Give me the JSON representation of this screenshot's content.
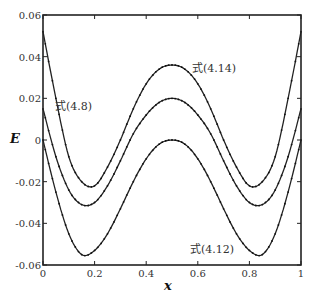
{
  "chart_data": {
    "type": "line",
    "title": "",
    "xlabel": "x",
    "ylabel": "E",
    "xlim": [
      0,
      1
    ],
    "ylim": [
      -0.06,
      0.06
    ],
    "grid": false,
    "legend": "none (inline annotations)",
    "x_ticks": [
      "0",
      "0.2",
      "0.4",
      "0.6",
      "0.8",
      "1"
    ],
    "y_ticks": [
      "-0.06",
      "-0.04",
      "-0.02",
      "0",
      "0.02",
      "0.04",
      "0.06"
    ],
    "x": [
      0,
      0.05,
      0.1,
      0.15,
      0.2,
      0.25,
      0.3,
      0.35,
      0.4,
      0.45,
      0.5,
      0.55,
      0.6,
      0.65,
      0.7,
      0.75,
      0.8,
      0.85,
      0.9,
      0.95,
      1.0
    ],
    "series": [
      {
        "name": "式(4.14)",
        "values": [
          0.052,
          0.02,
          -0.008,
          -0.02,
          -0.022,
          -0.013,
          0.0,
          0.015,
          0.027,
          0.034,
          0.036,
          0.034,
          0.027,
          0.015,
          0.0,
          -0.013,
          -0.022,
          -0.02,
          -0.008,
          0.02,
          0.052
        ]
      },
      {
        "name": "式(4.8)",
        "values": [
          0.015,
          -0.008,
          -0.024,
          -0.031,
          -0.03,
          -0.022,
          -0.01,
          0.003,
          0.012,
          0.018,
          0.02,
          0.018,
          0.012,
          0.003,
          -0.01,
          -0.022,
          -0.03,
          -0.031,
          -0.024,
          -0.008,
          0.015
        ]
      },
      {
        "name": "式(4.12)",
        "values": [
          0.0,
          -0.025,
          -0.045,
          -0.055,
          -0.053,
          -0.045,
          -0.033,
          -0.02,
          -0.009,
          -0.002,
          0.0,
          -0.002,
          -0.009,
          -0.02,
          -0.033,
          -0.045,
          -0.053,
          -0.055,
          -0.045,
          -0.025,
          0.0
        ]
      }
    ],
    "annotations": [
      {
        "text": "式(4.14)",
        "x": 0.6,
        "y": 0.037
      },
      {
        "text": "式(4.8)",
        "x": 0.1,
        "y": 0.018
      },
      {
        "text": "式(4.12)",
        "x": 0.64,
        "y": -0.054
      }
    ]
  }
}
